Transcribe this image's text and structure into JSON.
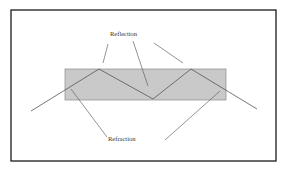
{
  "diagram": {
    "labels": {
      "reflection": "Reflection",
      "refraction": "Refraction"
    },
    "colors": {
      "frame_border": "#1a1a1a",
      "medium_fill": "#c9c9c9",
      "medium_border": "#8a8a8a",
      "ray": "#555555",
      "leader_line": "#666666",
      "background": "#ffffff"
    },
    "frame": {
      "x": 11,
      "y": 10,
      "width": 265,
      "height": 151
    },
    "medium": {
      "x": 65,
      "y": 69,
      "width": 161,
      "height": 31
    },
    "ray_path": [
      [
        31,
        111
      ],
      [
        99,
        69
      ],
      [
        153,
        99
      ],
      [
        191,
        69
      ],
      [
        257,
        109
      ]
    ],
    "reflection_leaders": [
      [
        [
          108,
          44
        ],
        [
          103,
          63
        ]
      ],
      [
        [
          133,
          41
        ],
        [
          148,
          86
        ]
      ],
      [
        [
          154,
          43
        ],
        [
          183,
          63
        ]
      ]
    ],
    "refraction_leaders": [
      [
        [
          71,
          89
        ],
        [
          107,
          137
        ]
      ],
      [
        [
          220,
          91
        ],
        [
          165,
          140
        ]
      ]
    ]
  }
}
